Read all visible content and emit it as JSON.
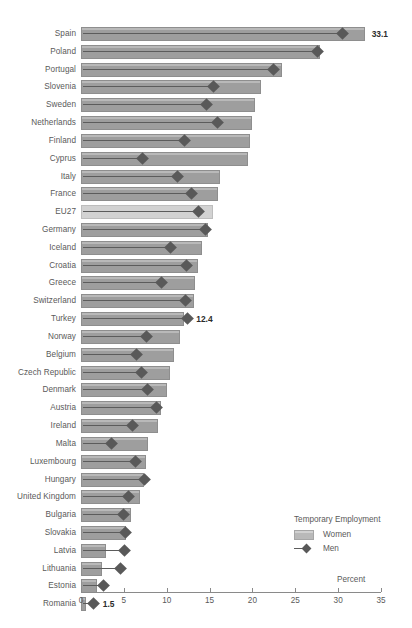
{
  "chart_data": {
    "type": "bar",
    "title": "",
    "subtitle": "",
    "xlabel": "Percent",
    "ylabel": "",
    "xlim": [
      0,
      35
    ],
    "xticks": [
      0,
      5,
      10,
      15,
      20,
      25,
      30,
      35
    ],
    "grid": false,
    "orientation": "horizontal",
    "legend": {
      "title": "Temporary Employment",
      "position": "bottom-right",
      "entries": [
        {
          "name": "Women",
          "marker": "bar-swatch"
        },
        {
          "name": "Men",
          "marker": "line-with-diamond"
        }
      ]
    },
    "categories": [
      "Spain",
      "Poland",
      "Portugal",
      "Slovenia",
      "Sweden",
      "Netherlands",
      "Finland",
      "Cyprus",
      "Italy",
      "France",
      "EU27",
      "Germany",
      "Iceland",
      "Croatia",
      "Greece",
      "Switzerland",
      "Turkey",
      "Norway",
      "Belgium",
      "Czech Republic",
      "Denmark",
      "Austria",
      "Ireland",
      "Malta",
      "Luxembourg",
      "Hungary",
      "United Kingdom",
      "Bulgaria",
      "Slovakia",
      "Latvia",
      "Lithuania",
      "Estonia",
      "Romania"
    ],
    "series": [
      {
        "name": "Women",
        "values": [
          33.1,
          27.9,
          23.5,
          21.0,
          20.3,
          19.9,
          19.7,
          19.5,
          16.2,
          16.0,
          15.4,
          14.8,
          14.1,
          13.6,
          13.3,
          13.2,
          12.0,
          11.5,
          10.8,
          10.4,
          10.0,
          9.3,
          9.0,
          7.8,
          7.6,
          7.3,
          6.9,
          5.8,
          5.3,
          2.9,
          2.5,
          1.9,
          0.6
        ]
      },
      {
        "name": "Men",
        "values": [
          30.5,
          27.6,
          22.4,
          15.4,
          14.6,
          15.9,
          12.1,
          7.2,
          11.3,
          12.9,
          13.7,
          14.5,
          10.4,
          12.3,
          9.4,
          12.2,
          12.4,
          7.6,
          6.5,
          7.1,
          7.8,
          8.8,
          6.0,
          3.5,
          6.3,
          7.4,
          5.5,
          4.9,
          5.2,
          5.1,
          4.6,
          2.6,
          1.5
        ]
      }
    ],
    "annotations": [
      {
        "category": "Spain",
        "series": "Women",
        "text": "33.1"
      },
      {
        "category": "Turkey",
        "series": "Men",
        "text": "12.4"
      },
      {
        "category": "Romania",
        "series": "Men",
        "text": "1.5"
      }
    ],
    "highlighted_category": "EU27",
    "colors": {
      "bar": "#9e9e9e",
      "bar_highlight": "#d2d2d2",
      "marker": "#595959",
      "axis": "#8a8a8a",
      "text": "#5a5a5a",
      "annotation_text": "#2b2b2b",
      "background": "#ffffff"
    }
  }
}
